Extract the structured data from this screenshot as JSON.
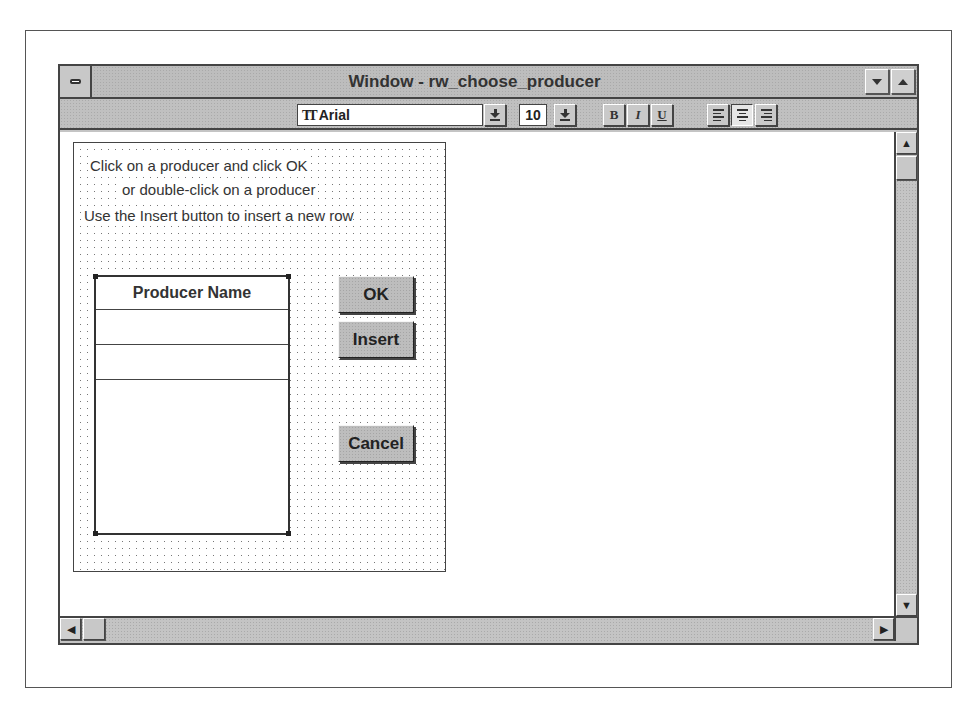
{
  "window": {
    "title": "Window - rw_choose_producer",
    "controls": {
      "system_menu": "system-menu",
      "minimize": "minimize",
      "maximize": "maximize"
    }
  },
  "toolbar": {
    "font_name": "Arial",
    "font_size": "10",
    "bold": "B",
    "italic": "I",
    "underline": "U",
    "align_active": "center"
  },
  "datawindow": {
    "instructions": [
      "Click on a producer and click OK",
      "or double-click on a producer",
      "Use the Insert button to insert a new row"
    ],
    "table": {
      "header": "Producer Name",
      "rows": [
        "",
        ""
      ]
    },
    "buttons": {
      "ok": "OK",
      "insert": "Insert",
      "cancel": "Cancel"
    }
  }
}
